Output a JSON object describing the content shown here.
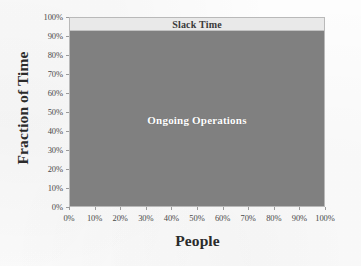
{
  "chart_data": {
    "type": "area",
    "title": "",
    "subtitle": "",
    "xlabel": "People",
    "ylabel": "Fraction of Time",
    "xlim": [
      0,
      100
    ],
    "ylim": [
      0,
      100
    ],
    "grid": false,
    "legend_position": "inline-annotations",
    "x_unit": "%",
    "y_unit": "%",
    "x_tick_labels": [
      "0%",
      "10%",
      "20%",
      "30%",
      "40%",
      "50%",
      "60%",
      "70%",
      "80%",
      "90%",
      "100%"
    ],
    "x_tick_values": [
      0,
      10,
      20,
      30,
      40,
      50,
      60,
      70,
      80,
      90,
      100
    ],
    "y_tick_labels": [
      "0%",
      "10%",
      "20%",
      "30%",
      "40%",
      "50%",
      "60%",
      "70%",
      "80%",
      "90%",
      "100%"
    ],
    "y_tick_values": [
      0,
      10,
      20,
      30,
      40,
      50,
      60,
      70,
      80,
      90,
      100
    ],
    "stacked": true,
    "stack_total": 100,
    "x": [
      0,
      100
    ],
    "series": [
      {
        "name": "Ongoing Operations",
        "values": [
          93,
          93
        ],
        "band_bottom": 0,
        "band_top": 93,
        "color": "#808080",
        "label_color": "#ffffff",
        "label_x": 50,
        "label_y": 46
      },
      {
        "name": "Slack Time",
        "values": [
          7,
          7
        ],
        "band_bottom": 93,
        "band_top": 100,
        "color": "#e9e9e9",
        "label_color": "#3a3a3a",
        "label_x": 50,
        "label_y": 96
      }
    ],
    "annotations": [
      {
        "text": "Slack Time",
        "x": 50,
        "y": 96
      },
      {
        "text": "Ongoing Operations",
        "x": 50,
        "y": 46
      }
    ],
    "colors": {
      "ongoing_operations": "#808080",
      "slack_time": "#e9e9e9",
      "frame": "#b9b9b9",
      "tick_text": "#4a4a4a",
      "axis_title": "#2b2b2b",
      "background": "#fdfdfd"
    }
  }
}
